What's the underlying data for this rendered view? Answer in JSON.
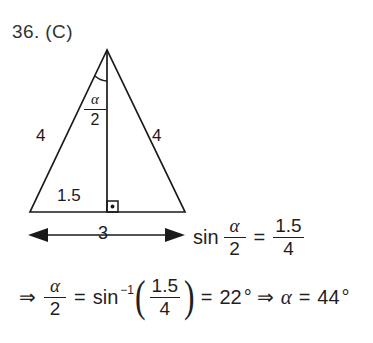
{
  "problem": {
    "number_and_choice": "36. (C)"
  },
  "figure": {
    "name": "isosceles-triangle-diagram",
    "geometry": {
      "apex": [
        107,
        50
      ],
      "base_left": [
        30,
        212
      ],
      "base_right": [
        185,
        212
      ],
      "altitude_foot": [
        107,
        212
      ],
      "dimension_arrow_y": 235,
      "dimension_arrow_x1": 28,
      "dimension_arrow_x2": 185
    },
    "stroke_color": "#1a1a1a",
    "labels": {
      "side_left": "4",
      "side_right": "4",
      "half_base": "1.5",
      "base": "3",
      "apex_angle_numerator": "α",
      "apex_angle_denominator": "2"
    },
    "markers": {
      "right_angle": "right-angle-square-with-dot",
      "apex_angle_arc": "angle-arc"
    }
  },
  "equations": {
    "sin_relation": {
      "fn": "sin",
      "arg_num": "α",
      "arg_den": "2",
      "equals": "=",
      "rhs_num": "1.5",
      "rhs_den": "4"
    },
    "alpha_solve": {
      "implies": "⇒",
      "lhs_num": "α",
      "lhs_den": "2",
      "equals_1": "=",
      "fn": "sin",
      "exponent": "−1",
      "paren_open": "(",
      "inner_num": "1.5",
      "inner_den": "4",
      "paren_close": ")",
      "equals_2": "=",
      "half_angle_value": "22",
      "degree": "°",
      "implies_2": "⇒",
      "alpha_symbol": "α",
      "equals_3": "=",
      "alpha_value": "44",
      "degree_2": "°"
    }
  }
}
